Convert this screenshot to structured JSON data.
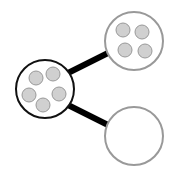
{
  "diagram": {
    "colors": {
      "edge": "#000000",
      "parent_stroke": "#111111",
      "child_stroke": "#999999",
      "dot_fill": "#d0d0d0",
      "dot_stroke": "#999999"
    },
    "nodes": [
      {
        "id": "parent",
        "cx": 45,
        "cy": 89,
        "r": 29,
        "dots": 5
      },
      {
        "id": "child-top",
        "cx": 134,
        "cy": 41,
        "r": 29,
        "dots": 4
      },
      {
        "id": "child-bottom",
        "cx": 134,
        "cy": 136,
        "r": 29,
        "dots": 0
      }
    ]
  }
}
